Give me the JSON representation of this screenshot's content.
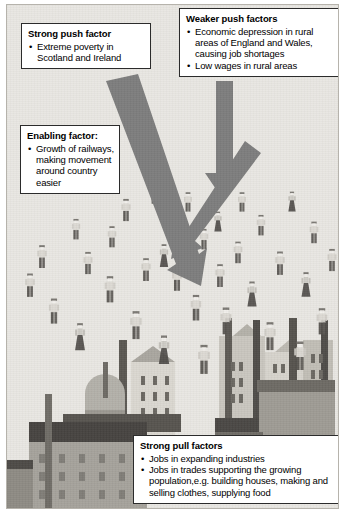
{
  "figure": {
    "background_color": "#e9e7e2",
    "arrow_color": "#7d7d7d",
    "box_border_color": "#2b2b2b",
    "box_fill_color": "#ffffff"
  },
  "callouts": {
    "strong_push": {
      "heading": "Strong push factor",
      "items": [
        "Extreme poverty in Scotland and Ireland"
      ]
    },
    "weaker_push": {
      "heading": "Weaker push factors",
      "items": [
        "Economic depression in rural areas of England and Wales, causing job shortages",
        "Low wages in rural areas"
      ]
    },
    "enabling": {
      "heading": "Enabling factor:",
      "items": [
        "Growth of railways, making movement around country easier"
      ]
    },
    "strong_pull": {
      "heading": "Strong pull factors",
      "items": [
        "Jobs in expanding industries",
        "Jobs in trades supporting the growing population,e.g. building houses, making and selling clothes, supplying food"
      ]
    }
  },
  "bullet_glyph": "•",
  "arrows": [
    {
      "name": "strong-push-arrow",
      "direction": "diagonal-down-right",
      "weight": "thick"
    },
    {
      "name": "weaker-push-arrow",
      "direction": "down",
      "weight": "medium"
    },
    {
      "name": "enabling-arrow",
      "direction": "diagonal-down-right",
      "weight": "medium"
    }
  ],
  "scene": {
    "crowd_label": "crowd of migrating people",
    "city_label": "industrial city with factories and chimneys",
    "crowd_count": 44,
    "figures": [
      {
        "x": 112,
        "y": 186,
        "s": 0.78,
        "t": "m"
      },
      {
        "x": 62,
        "y": 204,
        "s": 0.72,
        "t": "m"
      },
      {
        "x": 28,
        "y": 233,
        "s": 0.8,
        "t": "m"
      },
      {
        "x": 74,
        "y": 239,
        "s": 0.78,
        "t": "m"
      },
      {
        "x": 158,
        "y": 196,
        "s": 0.7,
        "t": "m"
      },
      {
        "x": 140,
        "y": 168,
        "s": 0.66,
        "t": "m"
      },
      {
        "x": 96,
        "y": 268,
        "s": 0.92,
        "t": "m"
      },
      {
        "x": 40,
        "y": 289,
        "s": 0.88,
        "t": "m"
      },
      {
        "x": 66,
        "y": 316,
        "s": 0.95,
        "t": "f"
      },
      {
        "x": 150,
        "y": 232,
        "s": 0.8,
        "t": "f"
      },
      {
        "x": 122,
        "y": 305,
        "s": 0.98,
        "t": "m"
      },
      {
        "x": 174,
        "y": 176,
        "s": 0.68,
        "t": "m"
      },
      {
        "x": 190,
        "y": 214,
        "s": 0.72,
        "t": "m"
      },
      {
        "x": 163,
        "y": 256,
        "s": 0.84,
        "t": "m"
      },
      {
        "x": 182,
        "y": 286,
        "s": 0.9,
        "t": "m"
      },
      {
        "x": 206,
        "y": 252,
        "s": 0.8,
        "t": "m"
      },
      {
        "x": 224,
        "y": 228,
        "s": 0.76,
        "t": "m"
      },
      {
        "x": 247,
        "y": 200,
        "s": 0.72,
        "t": "m"
      },
      {
        "x": 278,
        "y": 176,
        "s": 0.7,
        "t": "f"
      },
      {
        "x": 300,
        "y": 208,
        "s": 0.76,
        "t": "m"
      },
      {
        "x": 266,
        "y": 240,
        "s": 0.82,
        "t": "m"
      },
      {
        "x": 238,
        "y": 272,
        "s": 0.88,
        "t": "f"
      },
      {
        "x": 292,
        "y": 262,
        "s": 0.86,
        "t": "f"
      },
      {
        "x": 212,
        "y": 300,
        "s": 0.94,
        "t": "m"
      },
      {
        "x": 256,
        "y": 316,
        "s": 0.98,
        "t": "m"
      },
      {
        "x": 308,
        "y": 300,
        "s": 0.92,
        "t": "m"
      },
      {
        "x": 150,
        "y": 330,
        "s": 1.0,
        "t": "f"
      },
      {
        "x": 190,
        "y": 340,
        "s": 1.02,
        "t": "m"
      },
      {
        "x": 286,
        "y": 336,
        "s": 1.0,
        "t": "m"
      },
      {
        "x": 228,
        "y": 176,
        "s": 0.68,
        "t": "m"
      },
      {
        "x": 98,
        "y": 212,
        "s": 0.74,
        "t": "m"
      },
      {
        "x": 16,
        "y": 262,
        "s": 0.82,
        "t": "m"
      },
      {
        "x": 132,
        "y": 246,
        "s": 0.8,
        "t": "m"
      },
      {
        "x": 318,
        "y": 236,
        "s": 0.78,
        "t": "m"
      },
      {
        "x": 204,
        "y": 196,
        "s": 0.7,
        "t": "f"
      }
    ]
  }
}
